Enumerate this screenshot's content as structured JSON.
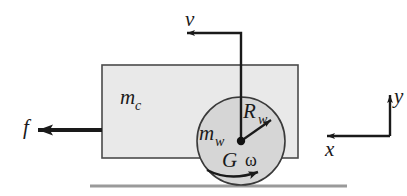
{
  "figure": {
    "colors": {
      "chassis_fill": "#e9e9e9",
      "wheel_fill": "#d6d6d6",
      "stroke": "#1a1a1a",
      "ground": "#9a9a9a",
      "background": "#ffffff"
    }
  },
  "labels": {
    "chassis_mass": "m",
    "chassis_mass_sub": "c",
    "wheel_mass": "m",
    "wheel_mass_sub": "w",
    "wheel_radius": "R",
    "wheel_radius_sub": "w",
    "friction_force": "f",
    "velocity": "v",
    "contact_point": "G",
    "angular_velocity": "ω",
    "axis_x": "x",
    "axis_y": "y"
  },
  "elements": {
    "chassis_name": "chassis-body",
    "wheel_name": "wheel-body",
    "ground_name": "ground-line",
    "velocity_arrow_name": "velocity-arrow",
    "friction_arrow_name": "friction-force-arrow",
    "radius_arrow_name": "wheel-radius-arrow",
    "rotation_arrow_name": "angular-velocity-arc-arrow",
    "axes_name": "coordinate-axes"
  },
  "geometry": {
    "chassis": {
      "x": 102,
      "y": 65,
      "width": 196,
      "height": 93
    },
    "wheel": {
      "cx": 241,
      "cy": 141,
      "r": 44
    },
    "ground": {
      "x1": 90,
      "x2": 347,
      "y": 186
    },
    "velocity_arrow": {
      "tip_x": 185,
      "y": 33,
      "corner_x": 241,
      "down_to_y": 140
    },
    "friction_arrow": {
      "tip_x": 28,
      "tail_x": 102,
      "y": 130
    },
    "radius_arrow": {
      "from_x": 241,
      "from_y": 141,
      "to_x": 273,
      "to_y": 119
    },
    "axes": {
      "origin_x": 390,
      "origin_y": 136,
      "y_tip": 91,
      "x_tip": 323
    }
  }
}
